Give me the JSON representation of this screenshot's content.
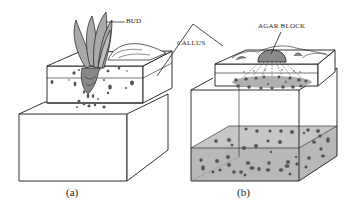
{
  "figure": {
    "panels": [
      {
        "id": "a",
        "caption": "(a)",
        "labels": {
          "bud": "BUD"
        }
      },
      {
        "id": "b",
        "caption": "(b)",
        "labels": {
          "agar_block": "AGAR BLOCK"
        }
      }
    ],
    "shared_labels": {
      "callus": "CALLUS"
    },
    "colors": {
      "line": "#1a1a1a",
      "gray_fill": "#b8b8b8",
      "leaf_fill": "#a9a9a9",
      "dot_fill": "#555555",
      "background": "#ffffff"
    }
  }
}
